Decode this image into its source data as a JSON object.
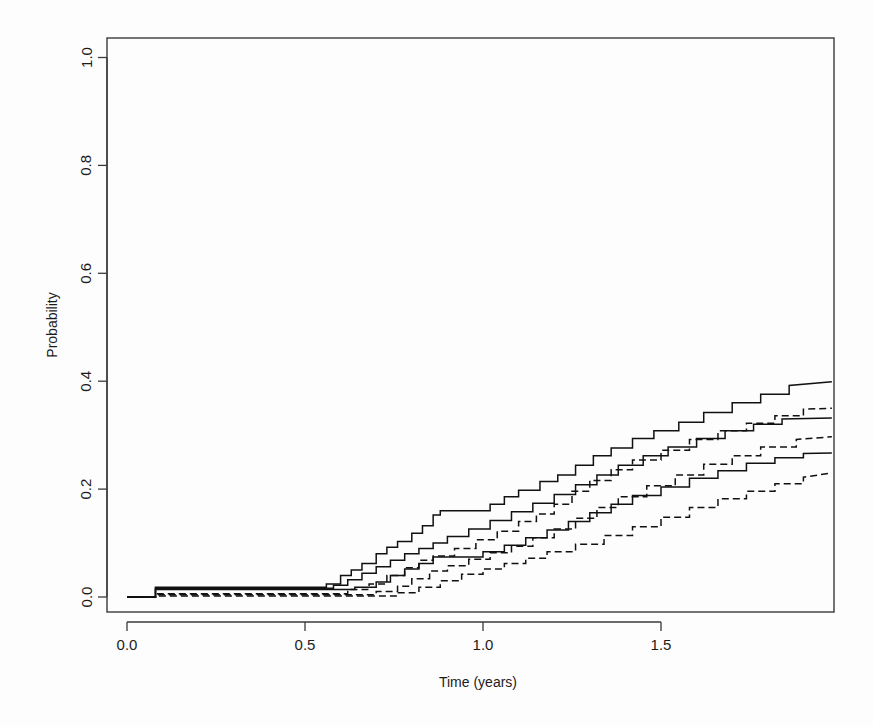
{
  "figure": {
    "background_color": "#fdfdfd",
    "line_color": "#111111",
    "axis_color": "#3a3a3a"
  },
  "chart_data": {
    "type": "line",
    "subtype": "step",
    "title": "",
    "subtitle": "",
    "xlabel": "Time (years)",
    "ylabel": "Probability",
    "xlim": [
      -0.03,
      1.98
    ],
    "ylim": [
      -0.03,
      1.05
    ],
    "xticks": [
      0.0,
      0.5,
      1.0,
      1.5
    ],
    "xticklabels": [
      "0.0",
      "0.5",
      "1.0",
      "1.5"
    ],
    "yticks": [
      0.0,
      0.2,
      0.4,
      0.6,
      0.8,
      1.0
    ],
    "yticklabels": [
      "0.0",
      "0.2",
      "0.4",
      "0.6",
      "0.8",
      "1.0"
    ],
    "grid": false,
    "legend": null,
    "legend_position": "none",
    "annotations": [],
    "series": [
      {
        "name": "curve-1-upper-solid",
        "style": "solid",
        "final_value": 0.4,
        "x": [
          0.0,
          0.08,
          0.08,
          0.56,
          0.56,
          0.6,
          0.6,
          0.63,
          0.63,
          0.66,
          0.66,
          0.7,
          0.7,
          0.73,
          0.73,
          0.76,
          0.76,
          0.8,
          0.8,
          0.83,
          0.83,
          0.86,
          0.86,
          0.88,
          0.88,
          1.02,
          1.02,
          1.06,
          1.06,
          1.1,
          1.1,
          1.16,
          1.16,
          1.21,
          1.21,
          1.26,
          1.26,
          1.31,
          1.31,
          1.36,
          1.36,
          1.42,
          1.42,
          1.48,
          1.48,
          1.55,
          1.55,
          1.62,
          1.62,
          1.7,
          1.7,
          1.78,
          1.78,
          1.86,
          1.86,
          1.98
        ],
        "y": [
          0.0,
          0.0,
          0.018,
          0.018,
          0.024,
          0.024,
          0.04,
          0.04,
          0.05,
          0.05,
          0.062,
          0.062,
          0.08,
          0.08,
          0.092,
          0.092,
          0.103,
          0.103,
          0.118,
          0.118,
          0.132,
          0.132,
          0.152,
          0.152,
          0.16,
          0.16,
          0.172,
          0.172,
          0.186,
          0.186,
          0.198,
          0.198,
          0.214,
          0.214,
          0.226,
          0.226,
          0.244,
          0.244,
          0.262,
          0.262,
          0.276,
          0.276,
          0.294,
          0.294,
          0.308,
          0.308,
          0.324,
          0.324,
          0.342,
          0.342,
          0.36,
          0.36,
          0.376,
          0.376,
          0.392,
          0.399
        ]
      },
      {
        "name": "curve-2-dashed",
        "style": "dashed",
        "final_value": 0.35,
        "x": [
          0.0,
          0.08,
          0.08,
          0.62,
          0.62,
          0.68,
          0.68,
          0.73,
          0.73,
          0.78,
          0.78,
          0.82,
          0.82,
          0.86,
          0.86,
          0.92,
          0.92,
          0.98,
          0.98,
          1.04,
          1.04,
          1.1,
          1.1,
          1.15,
          1.15,
          1.2,
          1.2,
          1.25,
          1.25,
          1.3,
          1.3,
          1.36,
          1.36,
          1.42,
          1.42,
          1.5,
          1.5,
          1.58,
          1.58,
          1.66,
          1.66,
          1.74,
          1.74,
          1.82,
          1.82,
          1.9,
          1.9,
          1.98
        ],
        "y": [
          0.0,
          0.0,
          0.006,
          0.006,
          0.014,
          0.014,
          0.024,
          0.024,
          0.04,
          0.04,
          0.054,
          0.054,
          0.068,
          0.068,
          0.076,
          0.076,
          0.09,
          0.09,
          0.106,
          0.106,
          0.122,
          0.122,
          0.14,
          0.14,
          0.154,
          0.154,
          0.172,
          0.172,
          0.196,
          0.196,
          0.216,
          0.216,
          0.236,
          0.236,
          0.254,
          0.254,
          0.272,
          0.272,
          0.292,
          0.292,
          0.308,
          0.308,
          0.322,
          0.322,
          0.336,
          0.336,
          0.348,
          0.35
        ]
      },
      {
        "name": "curve-3-middle-solid",
        "style": "solid",
        "final_value": 0.33,
        "x": [
          0.0,
          0.08,
          0.08,
          0.58,
          0.58,
          0.62,
          0.62,
          0.66,
          0.66,
          0.7,
          0.7,
          0.74,
          0.74,
          0.78,
          0.78,
          0.82,
          0.82,
          0.86,
          0.86,
          0.9,
          0.9,
          0.96,
          0.96,
          1.02,
          1.02,
          1.08,
          1.08,
          1.14,
          1.14,
          1.2,
          1.2,
          1.26,
          1.26,
          1.32,
          1.32,
          1.38,
          1.38,
          1.45,
          1.45,
          1.52,
          1.52,
          1.6,
          1.6,
          1.68,
          1.68,
          1.76,
          1.76,
          1.84,
          1.84,
          1.98
        ],
        "y": [
          0.0,
          0.0,
          0.016,
          0.016,
          0.022,
          0.022,
          0.032,
          0.032,
          0.044,
          0.044,
          0.056,
          0.056,
          0.068,
          0.068,
          0.08,
          0.08,
          0.09,
          0.09,
          0.1,
          0.1,
          0.112,
          0.112,
          0.126,
          0.126,
          0.142,
          0.142,
          0.158,
          0.158,
          0.174,
          0.174,
          0.19,
          0.19,
          0.208,
          0.208,
          0.226,
          0.226,
          0.244,
          0.244,
          0.262,
          0.262,
          0.278,
          0.278,
          0.294,
          0.294,
          0.308,
          0.308,
          0.32,
          0.32,
          0.33,
          0.332
        ]
      },
      {
        "name": "curve-4-dashed",
        "style": "dashed",
        "final_value": 0.3,
        "x": [
          0.0,
          0.08,
          0.08,
          0.7,
          0.7,
          0.76,
          0.76,
          0.8,
          0.8,
          0.85,
          0.85,
          0.9,
          0.9,
          0.96,
          0.96,
          1.02,
          1.02,
          1.08,
          1.08,
          1.14,
          1.14,
          1.2,
          1.2,
          1.26,
          1.26,
          1.32,
          1.32,
          1.38,
          1.38,
          1.46,
          1.46,
          1.54,
          1.54,
          1.62,
          1.62,
          1.7,
          1.7,
          1.78,
          1.78,
          1.88,
          1.88,
          1.98
        ],
        "y": [
          0.0,
          0.0,
          0.004,
          0.004,
          0.01,
          0.01,
          0.02,
          0.02,
          0.034,
          0.034,
          0.048,
          0.048,
          0.058,
          0.058,
          0.07,
          0.07,
          0.082,
          0.082,
          0.094,
          0.094,
          0.11,
          0.11,
          0.126,
          0.126,
          0.146,
          0.146,
          0.166,
          0.166,
          0.186,
          0.186,
          0.206,
          0.206,
          0.226,
          0.226,
          0.246,
          0.246,
          0.262,
          0.262,
          0.278,
          0.278,
          0.292,
          0.297
        ]
      },
      {
        "name": "curve-5-lower-solid",
        "style": "solid",
        "final_value": 0.27,
        "x": [
          0.0,
          0.08,
          0.08,
          0.64,
          0.64,
          0.7,
          0.7,
          0.74,
          0.74,
          0.78,
          0.78,
          0.82,
          0.82,
          0.86,
          0.86,
          1.0,
          1.0,
          1.06,
          1.06,
          1.12,
          1.12,
          1.18,
          1.18,
          1.24,
          1.24,
          1.3,
          1.3,
          1.36,
          1.36,
          1.42,
          1.42,
          1.5,
          1.5,
          1.58,
          1.58,
          1.66,
          1.66,
          1.74,
          1.74,
          1.82,
          1.82,
          1.9,
          1.9,
          1.98
        ],
        "y": [
          0.0,
          0.0,
          0.014,
          0.014,
          0.018,
          0.018,
          0.028,
          0.028,
          0.04,
          0.04,
          0.052,
          0.052,
          0.062,
          0.062,
          0.074,
          0.074,
          0.084,
          0.084,
          0.096,
          0.096,
          0.11,
          0.11,
          0.124,
          0.124,
          0.14,
          0.14,
          0.156,
          0.156,
          0.172,
          0.172,
          0.188,
          0.188,
          0.204,
          0.204,
          0.22,
          0.22,
          0.234,
          0.234,
          0.248,
          0.248,
          0.258,
          0.258,
          0.266,
          0.267
        ]
      },
      {
        "name": "curve-6-bottom-dashed",
        "style": "dashed",
        "final_value": 0.23,
        "x": [
          0.0,
          0.08,
          0.08,
          0.76,
          0.76,
          0.82,
          0.82,
          0.88,
          0.88,
          0.94,
          0.94,
          1.0,
          1.0,
          1.06,
          1.06,
          1.12,
          1.12,
          1.18,
          1.18,
          1.26,
          1.26,
          1.34,
          1.34,
          1.42,
          1.42,
          1.5,
          1.5,
          1.58,
          1.58,
          1.66,
          1.66,
          1.74,
          1.74,
          1.82,
          1.82,
          1.9,
          1.9,
          1.98
        ],
        "y": [
          0.0,
          0.0,
          0.002,
          0.002,
          0.008,
          0.008,
          0.018,
          0.018,
          0.03,
          0.03,
          0.042,
          0.042,
          0.052,
          0.052,
          0.062,
          0.062,
          0.072,
          0.072,
          0.084,
          0.084,
          0.098,
          0.098,
          0.114,
          0.114,
          0.13,
          0.13,
          0.148,
          0.148,
          0.166,
          0.166,
          0.182,
          0.182,
          0.196,
          0.196,
          0.21,
          0.21,
          0.222,
          0.23
        ]
      }
    ]
  }
}
